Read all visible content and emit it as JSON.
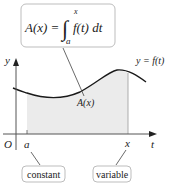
{
  "formula_box": {
    "lhs": "A(x) =",
    "integrand": "f(t) dt",
    "upper_limit": "x",
    "lower_limit": "a"
  },
  "axes": {
    "y_label": "y",
    "t_label": "t",
    "origin_label": "O"
  },
  "curve_label": "y = f(t)",
  "area_label": "A(x)",
  "points": {
    "a": "a",
    "x": "x"
  },
  "callouts": {
    "constant": "constant",
    "variable": "variable"
  },
  "colors": {
    "shade": "#ebebeb",
    "curve": "#1a1a1a",
    "box_border": "#bdbdbd"
  }
}
